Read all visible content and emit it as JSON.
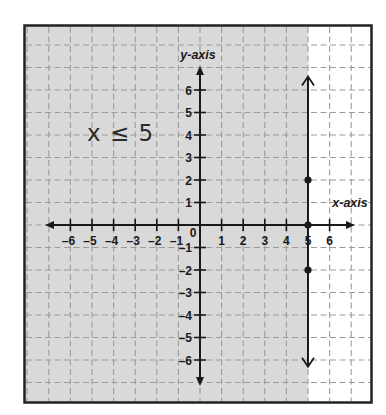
{
  "figure": {
    "annotation": "x ≤ 5",
    "x_axis_label": "x-axis",
    "y_axis_label": "y-axis",
    "origin_label": "0"
  },
  "colors": {
    "background": "#ffffff",
    "shade": "#d9d9d9",
    "grid": "#9c9c9c",
    "axis": "#1a1a1a",
    "frame": "#222222",
    "boundary_line": "#1a1a1a"
  },
  "chart_data": {
    "type": "line",
    "title": "",
    "xlabel": "x-axis",
    "ylabel": "y-axis",
    "xlim": [
      -7,
      7
    ],
    "ylim": [
      -7,
      7
    ],
    "grid": true,
    "annotation": "x ≤ 5",
    "x_ticks": [
      {
        "value": -6,
        "label": "–6"
      },
      {
        "value": -5,
        "label": "–5"
      },
      {
        "value": -4,
        "label": "–4"
      },
      {
        "value": -3,
        "label": "–3"
      },
      {
        "value": -2,
        "label": "–2"
      },
      {
        "value": -1,
        "label": "–1"
      },
      {
        "value": 1,
        "label": "1"
      },
      {
        "value": 2,
        "label": "2"
      },
      {
        "value": 3,
        "label": "3"
      },
      {
        "value": 4,
        "label": "4"
      },
      {
        "value": 5,
        "label": "5"
      },
      {
        "value": 6,
        "label": "6"
      }
    ],
    "y_ticks": [
      {
        "value": 6,
        "label": "6"
      },
      {
        "value": 5,
        "label": "5"
      },
      {
        "value": 4,
        "label": "4"
      },
      {
        "value": 3,
        "label": "3"
      },
      {
        "value": 2,
        "label": "2"
      },
      {
        "value": 1,
        "label": "1"
      },
      {
        "value": -1,
        "label": "–1"
      },
      {
        "value": -2,
        "label": "–2"
      },
      {
        "value": -3,
        "label": "–3"
      },
      {
        "value": -4,
        "label": "–4"
      },
      {
        "value": -5,
        "label": "–5"
      },
      {
        "value": -6,
        "label": "–6"
      }
    ],
    "series": [
      {
        "name": "x = 5",
        "kind": "vertical-boundary-line",
        "x": 5,
        "y_range": [
          -6.3,
          6.6
        ],
        "style": "solid",
        "arrows": "both-ends",
        "points": [
          [
            5,
            2
          ],
          [
            5,
            0
          ],
          [
            5,
            -2
          ]
        ]
      }
    ],
    "shaded_region": {
      "condition": "x ≤ 5",
      "side": "left of x = 5"
    }
  }
}
